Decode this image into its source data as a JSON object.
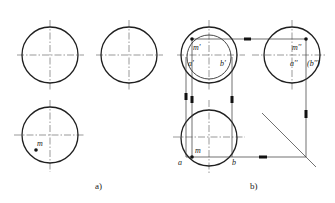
{
  "figure": {
    "panel_a": {
      "caption": "a)",
      "views": [
        {
          "name": "front-view",
          "cx": 50,
          "cy": 55,
          "r": 28
        },
        {
          "name": "side-view",
          "cx": 129,
          "cy": 55,
          "r": 28
        },
        {
          "name": "top-view",
          "cx": 50,
          "cy": 135,
          "r": 28
        }
      ],
      "point": {
        "label": "m",
        "x": 36,
        "y": 150
      }
    },
    "panel_b": {
      "caption": "b)",
      "views": [
        {
          "name": "front-view",
          "cx": 209,
          "cy": 55,
          "r": 28,
          "inner_r": 22
        },
        {
          "name": "side-view",
          "cx": 292,
          "cy": 55,
          "r": 28
        },
        {
          "name": "top-view",
          "cx": 209,
          "cy": 138,
          "r": 28
        }
      ],
      "labels": {
        "m_prime": "m'",
        "a_prime": "a'",
        "b_prime": "b'",
        "m_double_prime": "m''",
        "a_double_prime": "a''",
        "b_double_prime": "(b'')",
        "m": "m",
        "a": "a",
        "b": "b"
      }
    }
  }
}
